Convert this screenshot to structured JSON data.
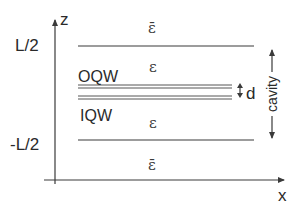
{
  "axes": {
    "z_label": "z",
    "x_label": "x",
    "top_tick": "L/2",
    "bottom_tick": "-L/2"
  },
  "regions": {
    "outer_top": "ε̄",
    "inner_top": "ε",
    "inner_bottom": "ε",
    "outer_bottom": "ε̄"
  },
  "quantum_wells": {
    "outer": "OQW",
    "inner": "IQW",
    "separation_label": "d"
  },
  "cavity_label": "cavity",
  "colors": {
    "line": "#3a3a3a",
    "text": "#2a2a2a",
    "background": "#ffffff"
  }
}
